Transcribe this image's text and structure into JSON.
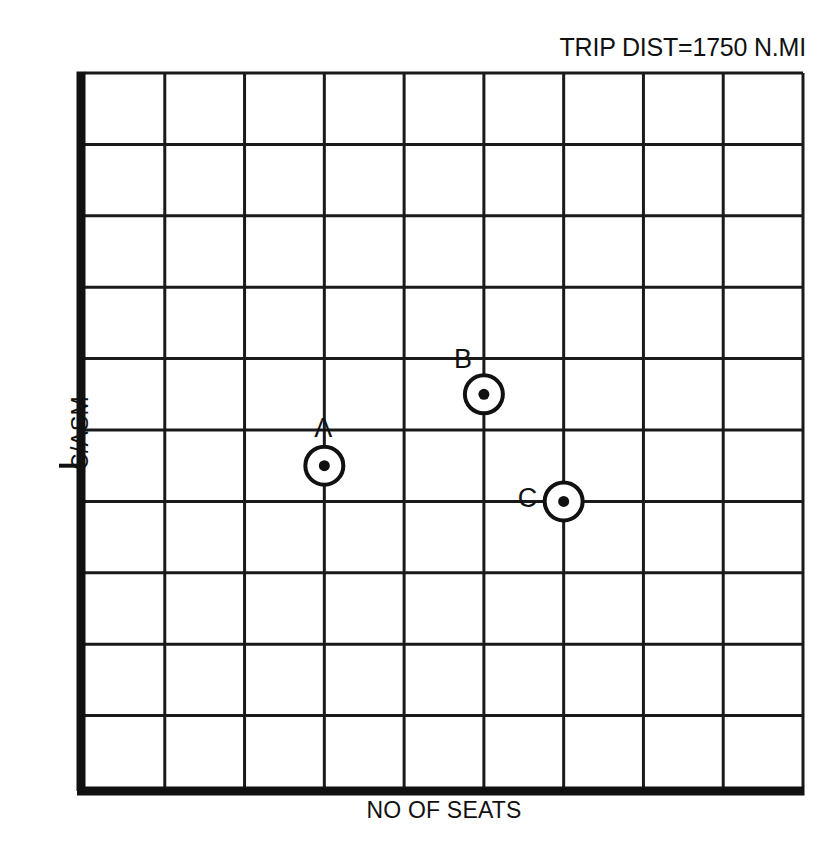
{
  "chart_data": {
    "type": "scatter",
    "title": "TRIP DIST=1750 N.MI",
    "xlabel": "NO OF SEATS",
    "ylabel": "C/ASM",
    "grid": true,
    "grid_columns": 9,
    "grid_rows": 10,
    "axis_ticks_labeled": false,
    "xlim": [
      0,
      9
    ],
    "ylim": [
      0,
      10
    ],
    "legend": "none",
    "points": [
      {
        "label": "A",
        "x": 3,
        "y": 4.5,
        "label_position": "above"
      },
      {
        "label": "B",
        "x": 5,
        "y": 5.5,
        "label_position": "above-left"
      },
      {
        "label": "C",
        "x": 6,
        "y": 4.0,
        "label_position": "left"
      }
    ],
    "y_axis_tick_at": 4.5
  },
  "marker_style": {
    "shape": "circle-with-center-dot",
    "outline_color": "#111111",
    "fill_color": "#ffffff",
    "dot_color": "#111111"
  },
  "colors": {
    "background": "#ffffff",
    "ink": "#111111",
    "gridline": "#1a1a1a",
    "heavy_axis": "#111111"
  }
}
